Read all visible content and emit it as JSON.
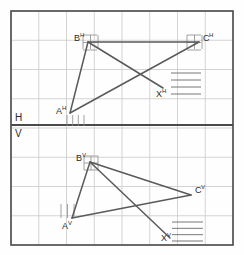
{
  "diagram": {
    "type": "orthographic-projection-drawing",
    "canvas": {
      "width": 244,
      "height": 255,
      "background": "#fefefe"
    },
    "frame": {
      "x": 11,
      "y": 11,
      "width": 222,
      "height": 234,
      "stroke": "#4a4a4a",
      "stroke_width": 1.6
    },
    "grid": {
      "columns": 8,
      "rows": 8,
      "cell_width": 27.75,
      "cell_height": 29.25,
      "stroke": "#c9c9c9",
      "stroke_width": 0.8,
      "visible": true
    },
    "ground_line": {
      "y": 125,
      "x1": 11,
      "x2": 233,
      "stroke": "#4a4a4a",
      "stroke_width": 2.0,
      "label_above": "H",
      "label_below": "V",
      "label_x": 15,
      "label_above_y": 121,
      "label_below_y": 137
    },
    "views": [
      {
        "name": "horizontal-projection",
        "plane": "H",
        "points": [
          {
            "id": "A_H",
            "label": "A",
            "superscript": "H",
            "x": 70,
            "y": 113,
            "label_x": 56,
            "label_y": 114
          },
          {
            "id": "B_H",
            "label": "B",
            "superscript": "H",
            "x": 88,
            "y": 42,
            "label_x": 74,
            "label_y": 41
          },
          {
            "id": "C_H",
            "label": "C",
            "superscript": "H",
            "x": 199,
            "y": 42,
            "label_x": 203,
            "label_y": 41
          },
          {
            "id": "X_H",
            "label": "X",
            "superscript": "H",
            "x": 163,
            "y": 88,
            "label_x": 156,
            "label_y": 97
          }
        ],
        "segments": [
          {
            "from": "A_H",
            "to": "B_H"
          },
          {
            "from": "B_H",
            "to": "C_H"
          },
          {
            "from": "A_H",
            "to": "C_H"
          },
          {
            "from": "B_H",
            "to": "X_H"
          }
        ],
        "hatch": {
          "x": 171,
          "y": 73,
          "width": 30,
          "height": 21,
          "lines": 4,
          "stroke": "#6a6a6a"
        },
        "ticks": [
          {
            "at": "A_H",
            "orientation": "vertical",
            "count": 4,
            "span": 17,
            "length": 11,
            "offset_x": -3,
            "offset_y": 2
          },
          {
            "at": "B_H",
            "orientation": "both",
            "count": 3,
            "span": 15,
            "length": 14,
            "offset_x": -5,
            "offset_y": -7
          },
          {
            "at": "C_H",
            "orientation": "both",
            "count": 3,
            "span": 15,
            "length": 14,
            "offset_x": -12,
            "offset_y": -7
          }
        ]
      },
      {
        "name": "vertical-projection",
        "plane": "V",
        "points": [
          {
            "id": "A_V",
            "label": "A",
            "superscript": "V",
            "x": 72,
            "y": 218,
            "label_x": 62,
            "label_y": 229
          },
          {
            "id": "B_V",
            "label": "B",
            "superscript": "V",
            "x": 90,
            "y": 162,
            "label_x": 76,
            "label_y": 161
          },
          {
            "id": "C_V",
            "label": "C",
            "superscript": "V",
            "x": 191,
            "y": 195,
            "label_x": 195,
            "label_y": 193
          },
          {
            "id": "X_V",
            "label": "X",
            "superscript": "V",
            "x": 170,
            "y": 238,
            "label_x": 161,
            "label_y": 241
          }
        ],
        "segments": [
          {
            "from": "A_V",
            "to": "B_V"
          },
          {
            "from": "B_V",
            "to": "C_V"
          },
          {
            "from": "A_V",
            "to": "C_V"
          },
          {
            "from": "B_V",
            "to": "X_V"
          }
        ],
        "hatch": {
          "x": 172,
          "y": 222,
          "width": 31,
          "height": 19,
          "lines": 4,
          "stroke": "#6a6a6a"
        },
        "ticks": [
          {
            "at": "A_V",
            "orientation": "vertical",
            "count": 3,
            "span": 13,
            "length": 14,
            "offset_x": -11,
            "offset_y": -14
          },
          {
            "at": "B_V",
            "orientation": "both",
            "count": 3,
            "span": 14,
            "length": 14,
            "offset_x": -6,
            "offset_y": -6
          }
        ]
      }
    ],
    "line_style": {
      "stroke": "#5a5a5a",
      "stroke_width": 1.5
    },
    "label_style": {
      "color": "#2b2b2b",
      "font_size": 9,
      "superscript_size": 6
    }
  }
}
